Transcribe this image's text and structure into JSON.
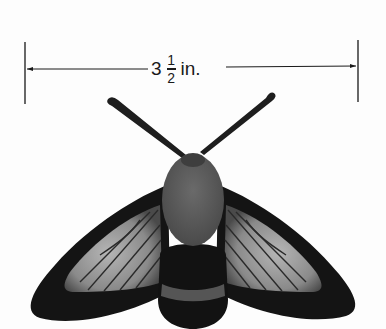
{
  "figure": {
    "measurement": {
      "whole": "3",
      "numerator": "1",
      "denominator": "2",
      "unit": "in.",
      "full_text": "3 1/2 in."
    },
    "colors": {
      "background": "#fdfdfd",
      "line": "#1a1a1a",
      "wing_dark": "#141414",
      "wing_light": "#9a9a9a",
      "thorax": "#5e5e5e",
      "abdomen": "#121212",
      "abdomen_band": "#555555",
      "antenna": "#1e1e1e"
    }
  }
}
